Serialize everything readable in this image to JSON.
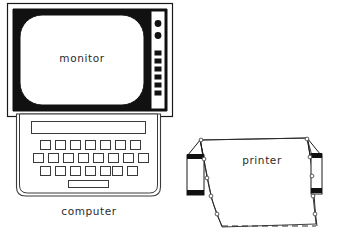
{
  "illustration": {
    "title": "Computer equipment line drawing",
    "background_color": "#ffffff",
    "ink_color": "#1a1a1a",
    "fill_color": "#ffffff"
  },
  "monitor": {
    "label": "monitor",
    "bezel_color": "#111111",
    "screen_color": "#ffffff",
    "outer_frame_color": "#1a1a1a",
    "controls": {
      "knob_count": 2,
      "knob_shape": "circle",
      "button_count": 6,
      "button_shape": "square",
      "panel_color": "#ffffff"
    }
  },
  "computer": {
    "label": "computer",
    "case_color": "#ffffff",
    "keyboard": {
      "display_strip_label": "",
      "rows": [
        7,
        8,
        7
      ],
      "spacebar": true,
      "key_color": "#ffffff",
      "key_border_color": "#3a3a3a"
    }
  },
  "printer": {
    "label": "printer",
    "paper_color": "#ffffff",
    "tractor_color": "#111111",
    "sprocket_holes_left": 5,
    "sprocket_holes_right": 5,
    "perforation_style": "dashed"
  }
}
